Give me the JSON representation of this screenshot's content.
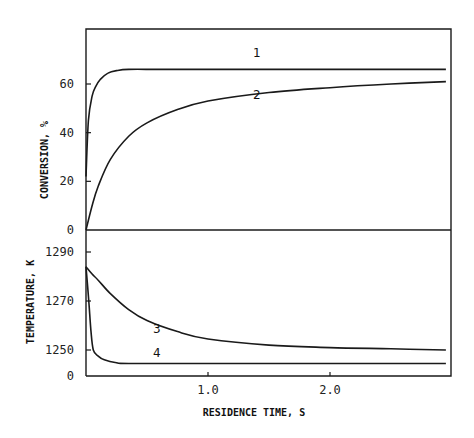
{
  "chart_data": {
    "type": "line",
    "title": "",
    "xlabel": "RESIDENCE TIME, S",
    "xlim": [
      0,
      2.95
    ],
    "x_ticks": [
      {
        "value": 1.0,
        "label": "1.0"
      },
      {
        "value": 2.0,
        "label": "2.0"
      }
    ],
    "grid": false,
    "legend": "inline curve numbers",
    "panels": [
      {
        "name": "conversion",
        "ylabel": "CONVERSION, %",
        "ylim": [
          0,
          82
        ],
        "y_ticks": [
          {
            "value": 0,
            "label": "0"
          },
          {
            "value": 20,
            "label": "20"
          },
          {
            "value": 40,
            "label": "40"
          },
          {
            "value": 60,
            "label": "60"
          }
        ],
        "series": [
          {
            "name": "1",
            "label_pos": {
              "x": 1.4,
              "y": 71
            },
            "x": [
              0,
              0.02,
              0.05,
              0.08,
              0.12,
              0.18,
              0.25,
              0.35,
              0.6,
              1.0,
              2.0,
              2.95
            ],
            "values": [
              22,
              45,
              55,
              59,
              62,
              64.5,
              65.5,
              66,
              66,
              66,
              66,
              66
            ]
          },
          {
            "name": "2",
            "label_pos": {
              "x": 1.4,
              "y": 54
            },
            "x": [
              0,
              0.05,
              0.1,
              0.2,
              0.35,
              0.5,
              0.75,
              1.0,
              1.5,
              2.0,
              2.5,
              2.95
            ],
            "values": [
              0,
              10,
              18,
              29,
              38.5,
              44,
              49.5,
              53,
              56.5,
              58.5,
              60,
              61
            ]
          }
        ]
      },
      {
        "name": "temperature",
        "ylabel": "TEMPERATURE, K",
        "ylim": [
          1240,
          1297
        ],
        "y_ticks": [
          {
            "value": 1240,
            "label": "0"
          },
          {
            "value": 1250,
            "label": "1250"
          },
          {
            "value": 1270,
            "label": "1270"
          },
          {
            "value": 1290,
            "label": "1290"
          }
        ],
        "series": [
          {
            "name": "3",
            "label_pos": {
              "x": 0.58,
              "y": 1257
            },
            "x": [
              0,
              0.05,
              0.1,
              0.2,
              0.35,
              0.5,
              0.75,
              1.0,
              1.5,
              2.0,
              2.5,
              2.95
            ],
            "values": [
              1284,
              1281,
              1278.5,
              1273,
              1266.5,
              1262,
              1257.5,
              1254.5,
              1252,
              1251,
              1250.5,
              1250
            ]
          },
          {
            "name": "4",
            "label_pos": {
              "x": 0.58,
              "y": 1247
            },
            "x": [
              0,
              0.02,
              0.04,
              0.06,
              0.1,
              0.15,
              0.25,
              0.35,
              1.0,
              2.0,
              2.95
            ],
            "values": [
              1284,
              1272,
              1258,
              1250,
              1247.5,
              1246,
              1244.8,
              1244.5,
              1244.5,
              1244.5,
              1244.5
            ]
          }
        ]
      }
    ]
  }
}
